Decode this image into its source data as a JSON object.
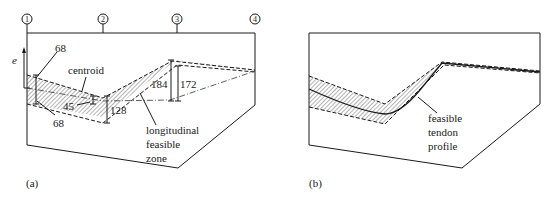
{
  "figure": {
    "panel_a": {
      "label": "(a)",
      "section_markers": [
        "1",
        "2",
        "3",
        "4"
      ],
      "eccentricity_axis": "e",
      "annotations": {
        "top_bound_left": "68",
        "bottom_bound_left": "68",
        "centroid": "centroid",
        "offset_2": "45",
        "depth_2": "128",
        "depth_3_outer": "184",
        "depth_3_inner": "172",
        "zone_line1": "longitudinal",
        "zone_line2": "feasible",
        "zone_line3": "zone"
      }
    },
    "panel_b": {
      "label": "(b)",
      "annotations": {
        "line1": "feasible",
        "line2": "tendon",
        "line3": "profile"
      }
    }
  }
}
